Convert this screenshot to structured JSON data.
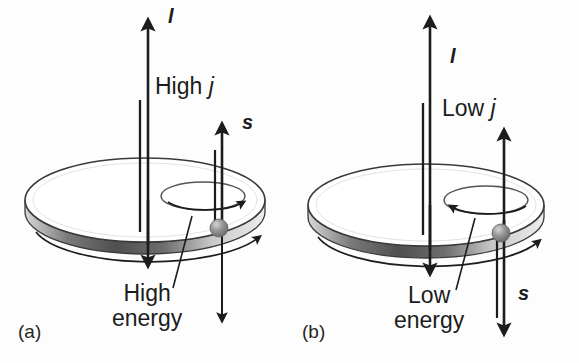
{
  "figure": {
    "background_color": "#fdfdfd",
    "ink_color": "#1c1c1c",
    "disk_rim_dark": "#4a4a4a",
    "disk_rim_light": "#e8e8e8",
    "electron_color": "#8c8c8c"
  },
  "panels": [
    {
      "id": "a",
      "caption": "(a)",
      "orbital_label": "l",
      "spin_label": "s",
      "quantum_number_label": "High j",
      "energy_label_line1": "High",
      "energy_label_line2": "energy",
      "spin_direction": "up",
      "spin_label_position": "top",
      "orbit_arrow_direction": "right"
    },
    {
      "id": "b",
      "caption": "(b)",
      "orbital_label": "l",
      "spin_label": "s",
      "quantum_number_label": "Low j",
      "energy_label_line1": "Low",
      "energy_label_line2": "energy",
      "spin_direction": "down",
      "spin_label_position": "bottom",
      "orbit_arrow_direction": "left"
    }
  ]
}
